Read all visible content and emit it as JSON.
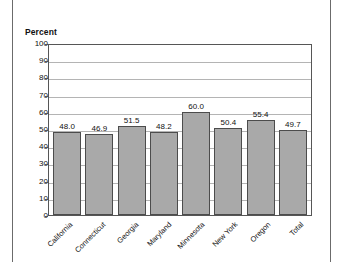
{
  "figure": {
    "axis_title": "Percent",
    "frame_color": "#6b6b6b",
    "bar_fill": "#a9a9a9",
    "bar_border": "#4c4c4c",
    "grid_color": "#b4b4b4"
  },
  "chart_data": {
    "type": "bar",
    "title": "",
    "subtitle": "",
    "xlabel": "",
    "ylabel": "Percent",
    "ylim": [
      0,
      100
    ],
    "yticks": [
      0,
      10,
      20,
      30,
      40,
      50,
      60,
      70,
      80,
      90,
      100
    ],
    "ytick_labels": [
      "0",
      "10",
      "20",
      "30",
      "40",
      "50",
      "60",
      "70",
      "80",
      "90",
      "100"
    ],
    "grid": "horizontal",
    "legend": "none",
    "categories": [
      "California",
      "Connecticut",
      "Georgia",
      "Maryland",
      "Minnesota",
      "New York",
      "Oregon",
      "Total"
    ],
    "values": [
      48.0,
      46.9,
      51.5,
      48.2,
      60.0,
      50.4,
      55.4,
      49.7
    ],
    "value_labels": [
      "48.0",
      "46.9",
      "51.5",
      "48.2",
      "60.0",
      "50.4",
      "55.4",
      "49.7"
    ]
  }
}
